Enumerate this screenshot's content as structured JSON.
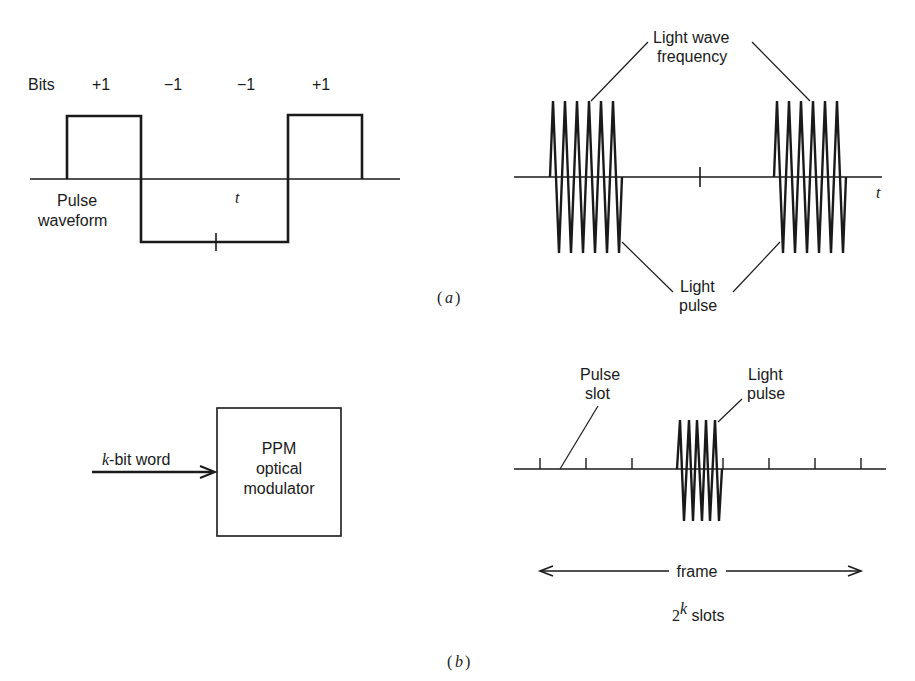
{
  "part_a": {
    "caption_open": "(",
    "caption_letter": "a",
    "caption_close": ")",
    "pulse_waveform": {
      "bits_label": "Bits",
      "bits": [
        "+1",
        "−1",
        "−1",
        "+1"
      ],
      "label_line1": "Pulse",
      "label_line2": "waveform",
      "axis_label": "t"
    },
    "light_modulation": {
      "top_label_line1": "Light wave",
      "top_label_line2": "frequency",
      "bottom_label_line1": "Light",
      "bottom_label_line2": "pulse",
      "axis_label": "t"
    }
  },
  "part_b": {
    "caption_open": "(",
    "caption_letter": "b",
    "caption_close": ")",
    "input_label_var": "k",
    "input_label_rest": "-bit word",
    "modulator_line1": "PPM",
    "modulator_line2": "optical",
    "modulator_line3": "modulator",
    "slot_label_line1": "Pulse",
    "slot_label_line2": "slot",
    "pulse_label_line1": "Light",
    "pulse_label_line2": "pulse",
    "frame_label": "frame",
    "slots_base": "2",
    "slots_exp": "k",
    "slots_rest": " slots"
  }
}
